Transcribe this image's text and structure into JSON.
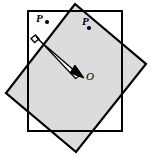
{
  "figure": {
    "width": 151,
    "height": 158,
    "background_color": "#ffffff",
    "stroke_color": "#000000",
    "square_fill_color": "#dcdcdc",
    "rectangle_fill_color": "#ffffff",
    "arrow_fill_color": "#ffffff"
  },
  "labels": {
    "point_p1": "P",
    "point_p2": "P",
    "point_o": "O"
  },
  "shapes": {
    "rectangle": {
      "name": "outlined-rectangle",
      "points": "28,11 122,11 122,131 28,131",
      "fill": "none",
      "stroke": "#000000",
      "stroke_width": 2
    },
    "rotated_square": {
      "name": "rotated-gray-square",
      "points": "75,4 146,64 76,152 6,93",
      "fill": "#dcdcdc",
      "stroke": "#000000",
      "stroke_width": 2.2
    },
    "arrow": {
      "name": "rotation-arrow",
      "shaft_left": "34.5,41.5 78,76.5",
      "shaft_right": "37.5,37.5 81.5,73",
      "head": "84,78 70,73 75,65",
      "tail": "31,38.5 35.5,35 39,39 34.5,42.5"
    },
    "dots": [
      {
        "name": "point-dot-p1",
        "cx": 47,
        "cy": 22,
        "r": 2.0
      },
      {
        "name": "point-dot-p2",
        "cx": 89,
        "cy": 28,
        "r": 2.0
      }
    ]
  }
}
